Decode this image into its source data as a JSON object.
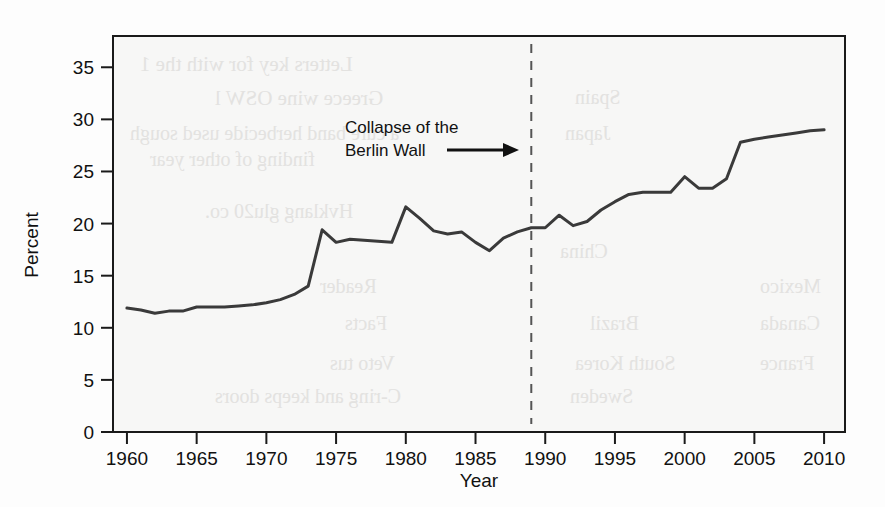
{
  "figure": {
    "axis_titles": {
      "x": "Year",
      "y": "Percent"
    },
    "annotation": {
      "line1": "Collapse of the",
      "line2": "Berlin Wall",
      "marker_year": 1989
    },
    "ghost_text": [
      "Letters key for with the 1",
      "Greece wine OSW l",
      "a cure band herbecide used sough",
      "finding of other year",
      "Hvklang glu20 co.",
      "Reader",
      "Facts",
      "Veto tus",
      "C-ring and keeps doors",
      "Japan",
      "Spain",
      "China",
      "South Korea",
      "Sweden",
      "Brazil",
      "Mexico",
      "Canada",
      "France"
    ]
  },
  "chart_data": {
    "type": "line",
    "title": "",
    "xlabel": "Year",
    "ylabel": "Percent",
    "xlim": [
      1959,
      2011.5
    ],
    "ylim": [
      0,
      38
    ],
    "xticks": [
      1960,
      1965,
      1970,
      1975,
      1980,
      1985,
      1990,
      1995,
      2000,
      2005,
      2010
    ],
    "yticks": [
      0,
      5,
      10,
      15,
      20,
      25,
      30,
      35
    ],
    "grid": false,
    "legend": "none",
    "line_color": "#3a3a3a",
    "annotations": [
      {
        "text": "Collapse of the Berlin Wall",
        "x": 1989,
        "type": "vline-dashed-with-arrow"
      }
    ],
    "x": [
      1960,
      1961,
      1962,
      1963,
      1964,
      1965,
      1966,
      1967,
      1968,
      1969,
      1970,
      1971,
      1972,
      1973,
      1974,
      1975,
      1976,
      1977,
      1978,
      1979,
      1980,
      1981,
      1982,
      1983,
      1984,
      1985,
      1986,
      1987,
      1988,
      1989,
      1990,
      1991,
      1992,
      1993,
      1994,
      1995,
      1996,
      1997,
      1998,
      1999,
      2000,
      2001,
      2002,
      2003,
      2004,
      2005,
      2006,
      2007,
      2008,
      2009,
      2010
    ],
    "values": [
      11.9,
      11.7,
      11.4,
      11.6,
      11.6,
      12.0,
      12.0,
      12.0,
      12.1,
      12.2,
      12.4,
      12.7,
      13.2,
      14.0,
      19.4,
      18.2,
      18.5,
      18.4,
      18.3,
      18.2,
      21.6,
      20.5,
      19.3,
      19.0,
      19.2,
      18.2,
      17.4,
      18.6,
      19.2,
      19.6,
      19.6,
      20.8,
      19.8,
      20.2,
      21.3,
      22.1,
      22.8,
      23.0,
      23.0,
      23.0,
      24.5,
      23.4,
      23.4,
      24.3,
      27.8,
      28.1,
      28.3,
      28.5,
      28.7,
      28.9,
      29.0
    ]
  }
}
